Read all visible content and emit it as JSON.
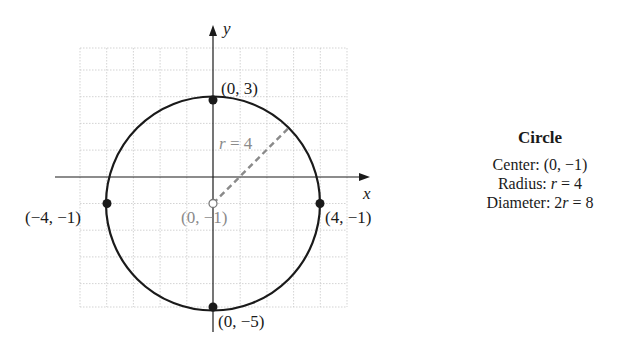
{
  "diagram": {
    "axes": {
      "x_label": "x",
      "y_label": "y"
    },
    "points": [
      {
        "label": "(0, 3)",
        "x": 0,
        "y": 3,
        "filled": true
      },
      {
        "label": "(−4, −1)",
        "x": -4,
        "y": -1,
        "filled": true
      },
      {
        "label": "(4, −1)",
        "x": 4,
        "y": -1,
        "filled": true
      },
      {
        "label": "(0, −5)",
        "x": 0,
        "y": -5,
        "filled": true
      },
      {
        "label": "(0, −1)",
        "x": 0,
        "y": -1,
        "filled": false
      }
    ],
    "radius_label_var": "r",
    "radius_label_rest": " = 4",
    "colors": {
      "curve": "#1a1a1a",
      "grid": "#c8c8c8",
      "radius": "#8a8a8a",
      "center_label": "#8a8a8a"
    }
  },
  "info_box": {
    "title": "Circle",
    "center_prefix": "Center: (0, −1)",
    "radius_prefix": "Radius: ",
    "radius_var": "r",
    "radius_rest": " = 4",
    "diameter_prefix": "Diameter: 2",
    "diameter_var": "r",
    "diameter_rest": " = 8"
  }
}
